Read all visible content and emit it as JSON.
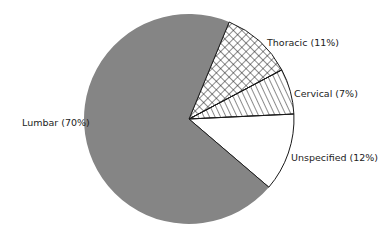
{
  "chart_data": {
    "type": "pie",
    "title": "",
    "slices": [
      {
        "label": "Thoracic",
        "value": 11,
        "display": "Thoracic (11%)",
        "fill": "crosshatch"
      },
      {
        "label": "Cervical",
        "value": 7,
        "display": "Cervical (7%)",
        "fill": "diagonal-hatch"
      },
      {
        "label": "Unspecified",
        "value": 12,
        "display": "Unspecified (12%)",
        "fill": "white"
      },
      {
        "label": "Lumbar",
        "value": 70,
        "display": "Lumbar (70%)",
        "fill": "gray"
      }
    ],
    "start_angle_deg": 67.5,
    "direction": "clockwise",
    "legend": "none (direct labels)",
    "colors": {
      "lumbar": "#858585",
      "outline": "#1a1a1a",
      "hatch": "#1a1a1a",
      "background": "#ffffff"
    }
  }
}
